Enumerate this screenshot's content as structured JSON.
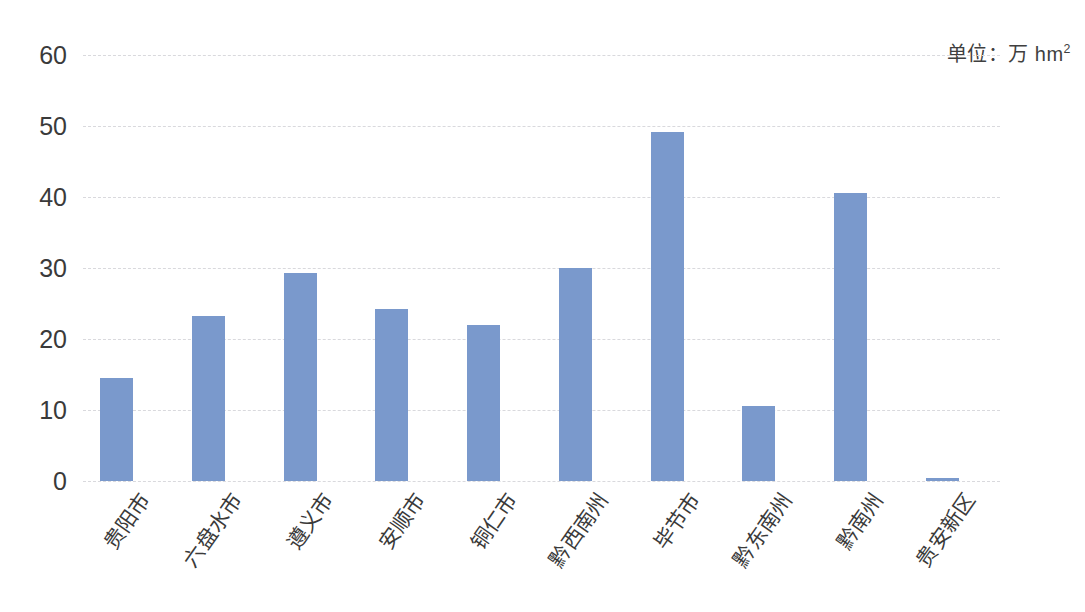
{
  "chart_data": {
    "type": "bar",
    "title": "",
    "subtitle": "",
    "xlabel": "",
    "ylabel": "",
    "unit_note": "单位：万 hm",
    "unit_exponent": "2",
    "categories": [
      "贵阳市",
      "六盘水市",
      "遵义市",
      "安顺市",
      "铜仁市",
      "黔西南州",
      "毕节市",
      "黔东南州",
      "黔南州",
      "贵安新区"
    ],
    "values": [
      14.5,
      23.2,
      29.3,
      24.2,
      22.0,
      30.0,
      49.2,
      10.5,
      40.6,
      0.4
    ],
    "ylim": [
      0,
      60
    ],
    "ytick_labels": [
      "0",
      "10",
      "20",
      "30",
      "40",
      "50",
      "60"
    ],
    "ytick_values": [
      0,
      10,
      20,
      30,
      40,
      50,
      60
    ],
    "grid": true,
    "grid_style": "dashed-horizontal",
    "legend": false,
    "legend_position": "none",
    "bar_color": "#7a99cc",
    "grid_color": "#d9d9dd",
    "text_color": "#3a3a3a",
    "background": "#ffffff",
    "bar_width_px": 33,
    "label_rotation_deg": -55
  }
}
